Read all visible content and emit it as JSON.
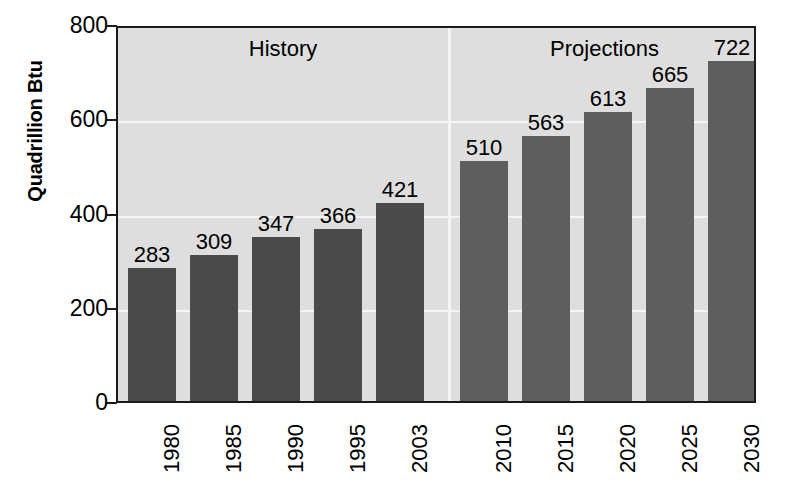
{
  "chart_data": {
    "type": "bar",
    "title": "",
    "subtitle": "",
    "xlabel": "",
    "ylabel": "Quadrillion Btu",
    "ylim": [
      0,
      800
    ],
    "yticks": [
      0,
      200,
      400,
      600,
      800
    ],
    "ytick_labels": [
      "0",
      "200",
      "400",
      "600",
      "800"
    ],
    "grid": "horizontal-white-gridlines-at-200-400-600",
    "legend": "none",
    "categories": [
      "1980",
      "1985",
      "1990",
      "1995",
      "2003",
      "2010",
      "2015",
      "2020",
      "2025",
      "2030"
    ],
    "values": [
      283,
      309,
      347,
      366,
      421,
      510,
      563,
      613,
      665,
      722
    ],
    "value_labels": [
      "283",
      "309",
      "347",
      "366",
      "421",
      "510",
      "563",
      "613",
      "665",
      "722"
    ],
    "bars": [
      {
        "category": "1980",
        "value": 283,
        "label": "283",
        "segment": "History"
      },
      {
        "category": "1985",
        "value": 309,
        "label": "309",
        "segment": "History"
      },
      {
        "category": "1990",
        "value": 347,
        "label": "347",
        "segment": "History"
      },
      {
        "category": "1995",
        "value": 366,
        "label": "366",
        "segment": "History"
      },
      {
        "category": "2003",
        "value": 421,
        "label": "421",
        "segment": "History"
      },
      {
        "category": "2010",
        "value": 510,
        "label": "510",
        "segment": "Projections"
      },
      {
        "category": "2015",
        "value": 563,
        "label": "563",
        "segment": "Projections"
      },
      {
        "category": "2020",
        "value": 613,
        "label": "613",
        "segment": "Projections"
      },
      {
        "category": "2025",
        "value": 665,
        "label": "665",
        "segment": "Projections"
      },
      {
        "category": "2030",
        "value": 722,
        "label": "722",
        "segment": "Projections"
      }
    ],
    "annotations": [
      {
        "name": "history-label",
        "text": "History"
      },
      {
        "name": "projections-label",
        "text": "Projections"
      }
    ],
    "colors": {
      "history_bar": "#4a4a4a",
      "projection_bar": "#5e5e5e",
      "plot_background": "#dedede",
      "gridline": "#f4f4f4",
      "axis": "#1a1a1a",
      "text": "#000000",
      "page_background": "#ffffff"
    }
  }
}
